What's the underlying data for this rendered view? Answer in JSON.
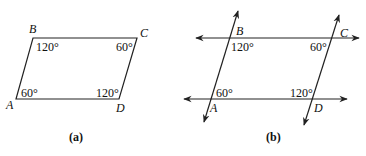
{
  "figure_a": {
    "caption": "(a)",
    "vertices": {
      "A": "A",
      "B": "B",
      "C": "C",
      "D": "D"
    },
    "angles": {
      "A": "60°",
      "B": "120°",
      "C": "60°",
      "D": "120°"
    }
  },
  "figure_b": {
    "caption": "(b)",
    "vertices": {
      "A": "A",
      "B": "B",
      "C": "C",
      "D": "D"
    },
    "angles": {
      "A": "60°",
      "B": "120°",
      "C": "60°",
      "D": "120°"
    }
  }
}
